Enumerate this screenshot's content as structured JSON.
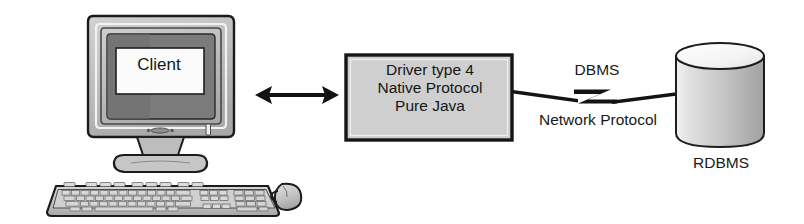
{
  "diagram": {
    "background_color": "#ffffff",
    "line_color": "#111111",
    "fill_gray": "#cccccc",
    "screen_dark_gray": "#7a7a7a",
    "nodes": {
      "client": {
        "icon": "desktop-computer-icon",
        "screen_text": "Client"
      },
      "driver": {
        "shape": "rectangle",
        "fill": "#cfcfcf",
        "lines": [
          "Driver type 4",
          "Native Protocol",
          "Pure Java"
        ]
      },
      "database": {
        "shape": "cylinder",
        "fill": "#c9c9c9",
        "label": "RDBMS"
      }
    },
    "connectors": {
      "client_to_driver": {
        "style": "double-headed-arrow",
        "label": ""
      },
      "driver_to_database": {
        "style": "lightning-bolt-link",
        "label_above": "DBMS",
        "label_below": "Network Protocol"
      }
    }
  }
}
